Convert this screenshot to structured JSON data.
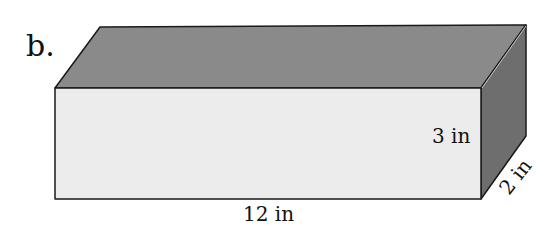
{
  "problem_label": "b.",
  "shape": "rectangular prism",
  "dimensions": {
    "length": "12 in",
    "height": "3 in",
    "width": "2 in"
  },
  "colors": {
    "front_face": "#ececec",
    "top_face": "#8a8a8a",
    "side_face": "#6e6e6e",
    "edge": "#1a1a1a"
  }
}
